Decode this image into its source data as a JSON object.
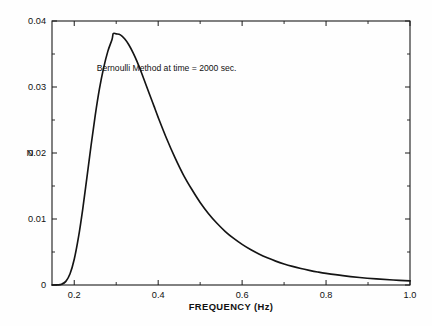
{
  "figure": {
    "background_color": "#fefefe",
    "frame_color": "#1a1a1a",
    "curve_color": "#141414"
  },
  "labels": {
    "ylabel": "N",
    "xlabel": "FREQUENCY (Hz)",
    "annotation": "Bernoulli Method at time = 2000 sec."
  },
  "chart_data": {
    "type": "line",
    "title": "",
    "subtitle": "",
    "xlabel": "FREQUENCY (Hz)",
    "ylabel": "N",
    "annotations": [
      {
        "text": "Bernoulli Method at time = 2000 sec.",
        "x": 0.42,
        "y": 0.0325
      }
    ],
    "legend": [],
    "legend_position": "none",
    "grid": false,
    "xlim": [
      0.147,
      1.0
    ],
    "ylim": [
      0.0,
      0.04
    ],
    "xticks": [
      0.2,
      0.4,
      0.6,
      0.8,
      1.0
    ],
    "xtick_labels": [
      "0.2",
      "0.4",
      "0.6",
      "0.8",
      "1.0"
    ],
    "x_minor_ticks": [
      0.3,
      0.5,
      0.7,
      0.9
    ],
    "yticks": [
      0,
      0.01,
      0.02,
      0.03,
      0.04
    ],
    "ytick_labels": [
      "0",
      "0.01",
      "0.02",
      "0.03",
      "0.04"
    ],
    "y_minor_ticks": [
      0.005,
      0.015,
      0.025,
      0.035
    ],
    "peak": {
      "x": 0.293,
      "y": 0.0381
    },
    "series": [
      {
        "name": "Bernoulli Method",
        "x": [
          0.147,
          0.16,
          0.17,
          0.18,
          0.19,
          0.2,
          0.21,
          0.22,
          0.23,
          0.24,
          0.25,
          0.26,
          0.27,
          0.28,
          0.29,
          0.293,
          0.3,
          0.31,
          0.32,
          0.33,
          0.34,
          0.35,
          0.36,
          0.37,
          0.38,
          0.39,
          0.4,
          0.42,
          0.44,
          0.46,
          0.48,
          0.5,
          0.52,
          0.54,
          0.56,
          0.58,
          0.6,
          0.62,
          0.64,
          0.66,
          0.68,
          0.7,
          0.72,
          0.74,
          0.76,
          0.78,
          0.8,
          0.84,
          0.88,
          0.92,
          0.96,
          1.0
        ],
        "y": [
          0.0,
          2e-05,
          0.00012,
          0.00055,
          0.0017,
          0.0039,
          0.0072,
          0.0114,
          0.0162,
          0.0211,
          0.0257,
          0.0297,
          0.0329,
          0.0354,
          0.0372,
          0.0381,
          0.03805,
          0.0379,
          0.0373,
          0.0364,
          0.0352,
          0.0338,
          0.0322,
          0.0305,
          0.0288,
          0.0271,
          0.0254,
          0.0222,
          0.0193,
          0.0167,
          0.0145,
          0.0125,
          0.0108,
          0.00935,
          0.0081,
          0.00705,
          0.00615,
          0.00537,
          0.0047,
          0.00412,
          0.00362,
          0.00319,
          0.00282,
          0.0025,
          0.00222,
          0.00197,
          0.00176,
          0.00141,
          0.00114,
          0.00093,
          0.00076,
          0.00063
        ]
      }
    ]
  }
}
